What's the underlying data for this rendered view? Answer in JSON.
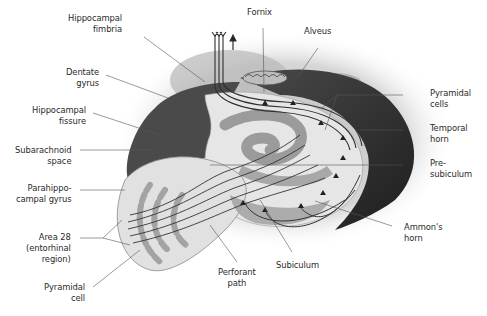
{
  "diagram": {
    "labels": {
      "hippocampal_fimbria": "Hippocampal\nfimbria",
      "fornix": "Fornix",
      "alveus": "Alveus",
      "dentate_gyrus": "Dentate\ngyrus",
      "pyramidal_cells": "Pyramidal\ncells",
      "hippocampal_fissure": "Hippocampal\nfissure",
      "temporal_horn": "Temporal\nhorn",
      "subarachnoid_space": "Subarachnoid\nspace",
      "presubiculum": "Pre-\nsubiculum",
      "parahippocampal_gyrus": "Parahippo-\ncampal gyrus",
      "ammons_horn": "Ammon's\nhorn",
      "area_28": "Area 28\n(entorhinal\nregion)",
      "subiculum": "Subiculum",
      "perforant_path": "Perforant\npath",
      "pyramidal_cell": "Pyramidal\ncell"
    },
    "colors": {
      "background": "#ffffff",
      "text": "#2a2a2a",
      "leader_line": "#555555",
      "dark_tissue": "#2b2b2b",
      "mid_tissue": "#8a8a8a",
      "light_tissue": "#d9d9d9",
      "pale_tissue": "#ececec",
      "fiber": "#3a3a3a"
    }
  }
}
